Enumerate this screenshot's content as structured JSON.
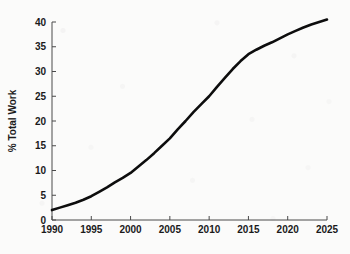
{
  "figure": {
    "background_color": "#fbfbfa",
    "line_color": "#0d0d0d",
    "axis_color": "#4a4a4a"
  },
  "chart_data": {
    "type": "line",
    "title": "",
    "subtitle": "",
    "xlabel": "",
    "ylabel": "% Total Work",
    "xlim": [
      1990,
      2025
    ],
    "ylim": [
      0,
      40
    ],
    "grid": false,
    "legend": null,
    "legend_position": "none",
    "x_ticks": [
      1990,
      1995,
      2000,
      2005,
      2010,
      2015,
      2020,
      2025
    ],
    "x_tick_labels": [
      "1990",
      "1995",
      "2000",
      "2005",
      "2010",
      "2015",
      "2020",
      "2025"
    ],
    "y_ticks": [
      0,
      5,
      10,
      15,
      20,
      25,
      30,
      35,
      40
    ],
    "y_tick_labels": [
      "0",
      "5",
      "10",
      "15",
      "20",
      "25",
      "30",
      "35",
      "40"
    ],
    "x": [
      1990,
      1991,
      1992,
      1993,
      1994,
      1995,
      1996,
      1997,
      1998,
      1999,
      2000,
      2001,
      2002,
      2003,
      2004,
      2005,
      2006,
      2007,
      2008,
      2009,
      2010,
      2011,
      2012,
      2013,
      2014,
      2015,
      2016,
      2017,
      2018,
      2019,
      2020,
      2021,
      2022,
      2023,
      2024,
      2025
    ],
    "values": [
      2.0,
      2.5,
      3.0,
      3.5,
      4.1,
      4.8,
      5.7,
      6.6,
      7.6,
      8.5,
      9.5,
      10.8,
      12.1,
      13.5,
      15.0,
      16.5,
      18.3,
      20.0,
      21.8,
      23.4,
      25.0,
      26.9,
      28.7,
      30.5,
      32.1,
      33.5,
      34.4,
      35.2,
      35.9,
      36.7,
      37.5,
      38.2,
      38.9,
      39.5,
      40.0,
      40.5
    ],
    "series": [
      {
        "name": "% Total Work",
        "values": [
          2.0,
          2.5,
          3.0,
          3.5,
          4.1,
          4.8,
          5.7,
          6.6,
          7.6,
          8.5,
          9.5,
          10.8,
          12.1,
          13.5,
          15.0,
          16.5,
          18.3,
          20.0,
          21.8,
          23.4,
          25.0,
          26.9,
          28.7,
          30.5,
          32.1,
          33.5,
          34.4,
          35.2,
          35.9,
          36.7,
          37.5,
          38.2,
          38.9,
          39.5,
          40.0,
          40.5
        ]
      }
    ]
  }
}
